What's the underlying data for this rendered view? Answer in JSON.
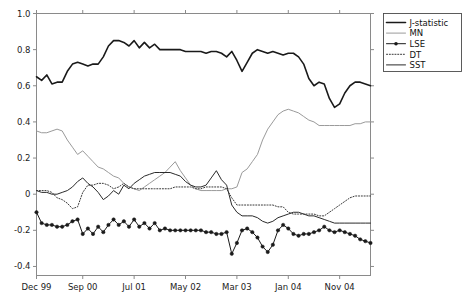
{
  "chart_data": {
    "type": "line",
    "title": "",
    "subtitle": "",
    "xlabel": "",
    "ylabel": "",
    "grid": false,
    "legend_position": "top-right",
    "xlim": [
      0,
      65
    ],
    "ylim": [
      -0.45,
      1.0
    ],
    "yticks": [
      1.0,
      0.8,
      0.6,
      0.4,
      0.2,
      0,
      -0.2,
      -0.4
    ],
    "ytick_labels": [
      "1.0",
      "0.8",
      "0.6",
      "0.4",
      "0.2",
      "0",
      "-0.2",
      "-0.4"
    ],
    "xticks": [
      0,
      9,
      19,
      29,
      39,
      49,
      59
    ],
    "xtick_labels": [
      "Dec 99",
      "Sep 00",
      "Jul 01",
      "May 02",
      "Mar 03",
      "Jan 04",
      "Nov 04"
    ],
    "x": [
      0,
      1,
      2,
      3,
      4,
      5,
      6,
      7,
      8,
      9,
      10,
      11,
      12,
      13,
      14,
      15,
      16,
      17,
      18,
      19,
      20,
      21,
      22,
      23,
      24,
      25,
      26,
      27,
      28,
      29,
      30,
      31,
      32,
      33,
      34,
      35,
      36,
      37,
      38,
      39,
      40,
      41,
      42,
      43,
      44,
      45,
      46,
      47,
      48,
      49,
      50,
      51,
      52,
      53,
      54,
      55,
      56,
      57,
      58,
      59,
      60,
      61,
      62,
      63,
      64,
      65
    ],
    "series": [
      {
        "name": "J-statistic",
        "color": "#1a1a1a",
        "style": "solid",
        "width": 1.6,
        "marker": "none",
        "values": [
          0.65,
          0.63,
          0.66,
          0.61,
          0.62,
          0.62,
          0.68,
          0.72,
          0.73,
          0.72,
          0.71,
          0.72,
          0.72,
          0.76,
          0.82,
          0.85,
          0.85,
          0.84,
          0.82,
          0.85,
          0.81,
          0.84,
          0.81,
          0.83,
          0.8,
          0.8,
          0.8,
          0.8,
          0.8,
          0.79,
          0.79,
          0.79,
          0.79,
          0.78,
          0.79,
          0.79,
          0.78,
          0.76,
          0.79,
          0.74,
          0.68,
          0.73,
          0.78,
          0.8,
          0.79,
          0.78,
          0.79,
          0.78,
          0.77,
          0.78,
          0.78,
          0.76,
          0.72,
          0.64,
          0.6,
          0.62,
          0.61,
          0.53,
          0.48,
          0.5,
          0.56,
          0.6,
          0.62,
          0.62,
          0.61,
          0.6
        ]
      },
      {
        "name": "MN",
        "color": "#9a9a9a",
        "style": "solid",
        "width": 1.0,
        "marker": "none",
        "values": [
          0.35,
          0.34,
          0.34,
          0.35,
          0.36,
          0.35,
          0.3,
          0.26,
          0.22,
          0.24,
          0.21,
          0.18,
          0.15,
          0.14,
          0.12,
          0.1,
          0.09,
          0.06,
          0.04,
          0.03,
          0.02,
          0.04,
          0.06,
          0.08,
          0.1,
          0.12,
          0.15,
          0.18,
          0.13,
          0.09,
          0.05,
          0.03,
          0.02,
          0.02,
          0.02,
          0.02,
          0.02,
          0.03,
          0.03,
          0.04,
          0.12,
          0.14,
          0.18,
          0.22,
          0.3,
          0.36,
          0.4,
          0.44,
          0.46,
          0.47,
          0.46,
          0.45,
          0.43,
          0.41,
          0.4,
          0.38,
          0.38,
          0.38,
          0.38,
          0.38,
          0.38,
          0.38,
          0.39,
          0.39,
          0.4,
          0.4
        ]
      },
      {
        "name": "LSE",
        "color": "#1a1a1a",
        "style": "solid",
        "width": 1.0,
        "marker": "circle",
        "values": [
          -0.1,
          -0.16,
          -0.17,
          -0.17,
          -0.18,
          -0.18,
          -0.17,
          -0.15,
          -0.14,
          -0.22,
          -0.19,
          -0.22,
          -0.18,
          -0.21,
          -0.17,
          -0.14,
          -0.17,
          -0.15,
          -0.18,
          -0.14,
          -0.18,
          -0.16,
          -0.19,
          -0.16,
          -0.2,
          -0.19,
          -0.2,
          -0.2,
          -0.2,
          -0.2,
          -0.2,
          -0.2,
          -0.2,
          -0.21,
          -0.21,
          -0.22,
          -0.22,
          -0.21,
          -0.33,
          -0.27,
          -0.2,
          -0.19,
          -0.21,
          -0.24,
          -0.29,
          -0.32,
          -0.28,
          -0.2,
          -0.17,
          -0.19,
          -0.22,
          -0.23,
          -0.22,
          -0.22,
          -0.21,
          -0.2,
          -0.18,
          -0.2,
          -0.21,
          -0.2,
          -0.21,
          -0.22,
          -0.23,
          -0.25,
          -0.26,
          -0.27
        ]
      },
      {
        "name": "DT",
        "color": "#3a3a3a",
        "style": "dotted",
        "width": 1.0,
        "marker": "none",
        "values": [
          0.02,
          0.02,
          0.02,
          0.01,
          -0.02,
          -0.03,
          -0.05,
          -0.08,
          -0.07,
          0.01,
          0.05,
          0.05,
          0.06,
          0.06,
          0.05,
          0.03,
          0.04,
          0.06,
          0.04,
          0.03,
          0.03,
          0.03,
          0.03,
          0.03,
          0.03,
          0.03,
          0.03,
          0.04,
          0.04,
          0.04,
          0.04,
          0.03,
          0.03,
          0.04,
          0.04,
          0.04,
          0.04,
          0.03,
          -0.02,
          -0.06,
          -0.06,
          -0.06,
          -0.06,
          -0.06,
          -0.06,
          -0.06,
          -0.06,
          -0.07,
          -0.07,
          -0.1,
          -0.11,
          -0.11,
          -0.11,
          -0.11,
          -0.11,
          -0.12,
          -0.12,
          -0.1,
          -0.08,
          -0.06,
          -0.04,
          -0.02,
          -0.01,
          -0.01,
          -0.01,
          -0.01
        ]
      },
      {
        "name": "SST",
        "color": "#2a2a2a",
        "style": "solid",
        "width": 1.0,
        "marker": "none",
        "values": [
          0.02,
          0.01,
          0.01,
          0.0,
          0.0,
          0.01,
          0.02,
          0.04,
          0.07,
          0.09,
          0.06,
          0.04,
          0.01,
          -0.03,
          -0.01,
          0.02,
          0.0,
          0.05,
          0.03,
          0.06,
          0.08,
          0.1,
          0.11,
          0.12,
          0.12,
          0.12,
          0.12,
          0.11,
          0.1,
          0.07,
          0.05,
          0.04,
          0.04,
          0.05,
          0.09,
          0.13,
          0.08,
          0.05,
          -0.06,
          -0.1,
          -0.12,
          -0.12,
          -0.12,
          -0.13,
          -0.15,
          -0.16,
          -0.15,
          -0.13,
          -0.12,
          -0.11,
          -0.1,
          -0.1,
          -0.11,
          -0.12,
          -0.12,
          -0.13,
          -0.14,
          -0.15,
          -0.16,
          -0.16,
          -0.16,
          -0.16,
          -0.16,
          -0.16,
          -0.16,
          -0.16
        ]
      }
    ]
  },
  "legend": {
    "items": [
      {
        "label": "J-statistic"
      },
      {
        "label": "MN"
      },
      {
        "label": "LSE"
      },
      {
        "label": "DT"
      },
      {
        "label": "SST"
      }
    ]
  },
  "axes": {
    "frame_color": "#8a8a8a",
    "tick_color": "#8a8a8a",
    "label_color": "#222222"
  }
}
